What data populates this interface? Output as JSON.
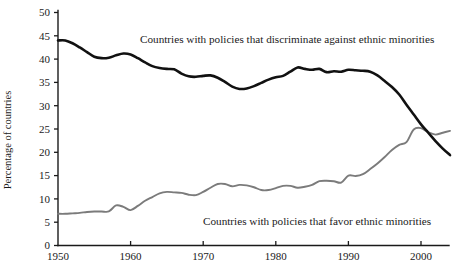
{
  "chart_data": {
    "type": "line",
    "title": "",
    "subtitle": "",
    "xlabel": "",
    "ylabel": "Percentage of countries",
    "xlim": [
      1950,
      2004
    ],
    "ylim": [
      0,
      50
    ],
    "grid": false,
    "legend_position": "inline-annotation",
    "x_ticks": [
      "1950",
      "1960",
      "1970",
      "1980",
      "1990",
      "2000"
    ],
    "x_tick_values": [
      1950,
      1960,
      1970,
      1980,
      1990,
      2000
    ],
    "y_ticks": [
      "0",
      "5",
      "10",
      "15",
      "20",
      "25",
      "30",
      "35",
      "40",
      "45",
      "50"
    ],
    "y_tick_values": [
      0,
      5,
      10,
      15,
      20,
      25,
      30,
      35,
      40,
      45,
      50
    ],
    "series": [
      {
        "name": "Countries with policies that discriminate against ethnic minorities",
        "color": "#111111",
        "annotation": "Countries with policies that discriminate against ethnic minorities",
        "x": [
          1950,
          1951,
          1952,
          1953,
          1954,
          1955,
          1956,
          1957,
          1958,
          1959,
          1960,
          1961,
          1962,
          1963,
          1964,
          1965,
          1966,
          1967,
          1968,
          1969,
          1970,
          1971,
          1972,
          1973,
          1974,
          1975,
          1976,
          1977,
          1978,
          1979,
          1980,
          1981,
          1982,
          1983,
          1984,
          1985,
          1986,
          1987,
          1988,
          1989,
          1990,
          1991,
          1992,
          1993,
          1994,
          1995,
          1996,
          1997,
          1998,
          1999,
          2000,
          2001,
          2002,
          2003,
          2004
        ],
        "y": [
          44.0,
          44.0,
          43.4,
          42.5,
          41.5,
          40.5,
          40.2,
          40.3,
          40.8,
          41.2,
          41.0,
          40.2,
          39.3,
          38.5,
          38.1,
          37.9,
          37.8,
          36.9,
          36.3,
          36.2,
          36.4,
          36.5,
          36.0,
          35.1,
          34.1,
          33.6,
          33.7,
          34.2,
          34.9,
          35.6,
          36.1,
          36.4,
          37.3,
          38.2,
          37.9,
          37.7,
          37.9,
          37.2,
          37.4,
          37.3,
          37.7,
          37.6,
          37.5,
          37.3,
          36.5,
          35.3,
          34.0,
          32.4,
          30.2,
          28.1,
          26.0,
          24.2,
          22.4,
          20.8,
          19.4
        ]
      },
      {
        "name": "Countries with policies that favor ethnic minorities",
        "color": "#7b7b7b",
        "annotation": "Countries with policies that favor ethnic minorities",
        "x": [
          1950,
          1951,
          1952,
          1953,
          1954,
          1955,
          1956,
          1957,
          1958,
          1959,
          1960,
          1961,
          1962,
          1963,
          1964,
          1965,
          1966,
          1967,
          1968,
          1969,
          1970,
          1971,
          1972,
          1973,
          1974,
          1975,
          1976,
          1977,
          1978,
          1979,
          1980,
          1981,
          1982,
          1983,
          1984,
          1985,
          1986,
          1987,
          1988,
          1989,
          1990,
          1991,
          1992,
          1993,
          1994,
          1995,
          1996,
          1997,
          1998,
          1999,
          2000,
          2001,
          2002,
          2003,
          2004
        ],
        "y": [
          6.8,
          6.8,
          6.9,
          7.0,
          7.2,
          7.3,
          7.3,
          7.3,
          8.6,
          8.3,
          7.6,
          8.5,
          9.6,
          10.4,
          11.2,
          11.5,
          11.4,
          11.3,
          10.9,
          10.8,
          11.5,
          12.4,
          13.2,
          13.2,
          12.7,
          13.0,
          12.9,
          12.5,
          11.9,
          11.9,
          12.3,
          12.8,
          12.8,
          12.4,
          12.6,
          13.0,
          13.8,
          13.9,
          13.8,
          13.5,
          15.0,
          14.9,
          15.3,
          16.4,
          17.6,
          19.0,
          20.5,
          21.6,
          22.2,
          24.9,
          25.2,
          24.3,
          23.8,
          24.2,
          24.6
        ]
      }
    ]
  },
  "annotations": {
    "discriminate_label": "Countries with policies that discriminate against ethnic minorities",
    "favor_label": "Countries with policies that favor ethnic minorities"
  },
  "axes": {
    "y_axis_title": "Percentage of countries"
  },
  "colors": {
    "discriminate": "#111111",
    "favor": "#7b7b7b",
    "axis": "#1a1a1a",
    "background": "#ffffff"
  }
}
